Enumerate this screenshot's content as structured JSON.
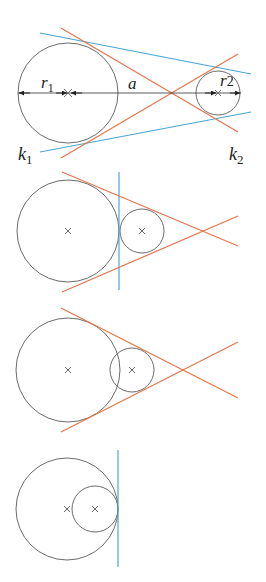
{
  "colors": {
    "circle": "#6b6b6b",
    "external_tangent": "#4aa6d8",
    "internal_tangent": "#e8744a",
    "axis": "#333333",
    "text": "#222222"
  },
  "figures": [
    {
      "id": "two-separate-circles",
      "labels": {
        "r1": "r",
        "r1_sub": "1",
        "a": "a",
        "r2": "r",
        "r2_sub": "2",
        "k1": "k",
        "k1_sub": "1",
        "k2": "k",
        "k2_sub": "2"
      },
      "big_circle": {
        "cx": 68,
        "cy": 93,
        "r": 50
      },
      "small_circle": {
        "cx": 218,
        "cy": 93,
        "r": 22
      },
      "external_tangents": 2,
      "internal_tangents": 2
    },
    {
      "id": "externally-touching-circles",
      "big_circle": {
        "cx": 68,
        "cy": 231,
        "r": 51
      },
      "small_circle": {
        "cx": 142,
        "cy": 231,
        "r": 22
      },
      "external_tangents": 2,
      "common_tangent_at_contact": 1
    },
    {
      "id": "intersecting-circles",
      "big_circle": {
        "cx": 68,
        "cy": 370,
        "r": 52
      },
      "small_circle": {
        "cx": 132,
        "cy": 370,
        "r": 22
      },
      "external_tangents": 2
    },
    {
      "id": "internally-touching-circles",
      "big_circle": {
        "cx": 67,
        "cy": 509,
        "r": 51
      },
      "small_circle": {
        "cx": 95,
        "cy": 509,
        "r": 23
      },
      "common_tangent_at_contact": 1
    }
  ]
}
